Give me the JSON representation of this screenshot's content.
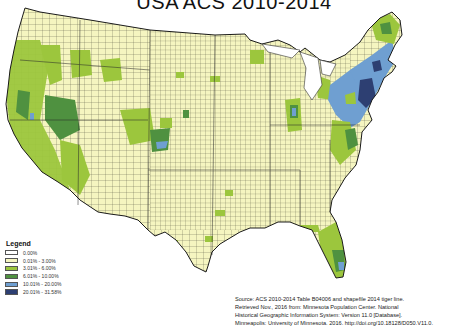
{
  "title": "USA ACS 2010-2014",
  "legend": {
    "title": "Legend",
    "items": [
      {
        "label": "0.00%",
        "color": "#ffffff"
      },
      {
        "label": "0.01% - 3.00%",
        "color": "#f5f5c0"
      },
      {
        "label": "3.01% - 6.00%",
        "color": "#9cc63d"
      },
      {
        "label": "6.01% - 10.00%",
        "color": "#4f9140"
      },
      {
        "label": "10.01% - 20.00%",
        "color": "#6f9fd1"
      },
      {
        "label": "20.01% - 31.58%",
        "color": "#2d3f72"
      }
    ]
  },
  "source": {
    "lines": [
      "Source: ACS 2010-2014 Table B04006 and shapefile 2014 tiger line.",
      "Retrieved Nov., 2016 from: Minnesota Population Center. National",
      "Historical Geographic Information System: Version 11.0 [Database].",
      "Minneapolis: University of Minnesota. 2016. http://doi.org/10.18128/D050.V11.0."
    ]
  },
  "map": {
    "region": "Contiguous United States, county level",
    "colors": {
      "base": "#f5f5c0",
      "low": "#9cc63d",
      "mid": "#4f9140",
      "high": "#6f9fd1",
      "top": "#2d3f72",
      "border": "#3a3a3a"
    }
  }
}
